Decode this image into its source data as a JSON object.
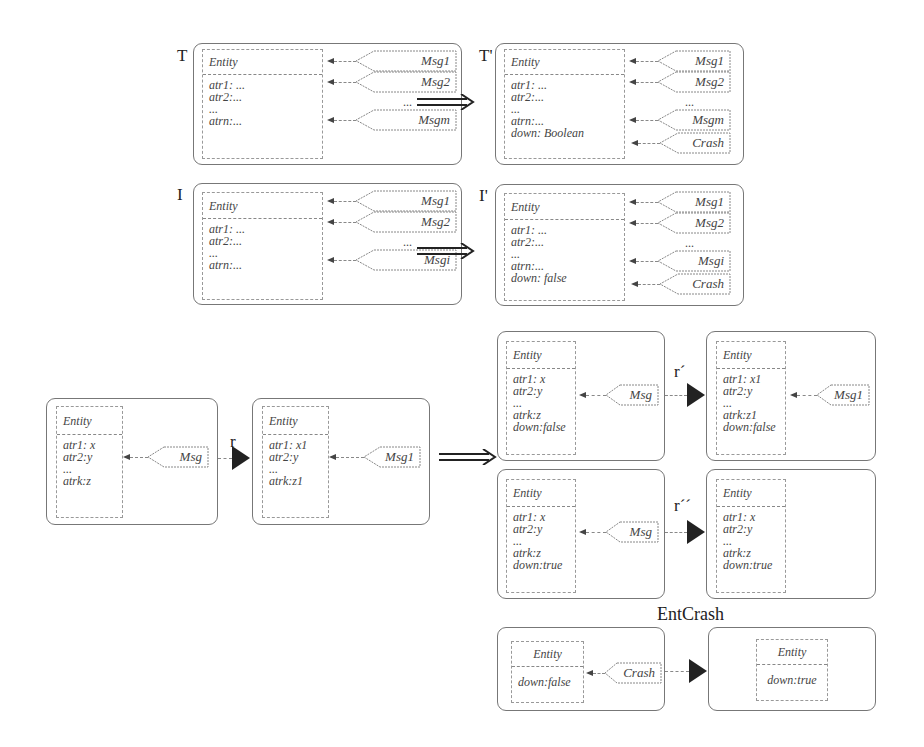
{
  "typeT": {
    "label": "T",
    "entity": "Entity",
    "attrs": [
      "atr1: ...",
      "atr2:...",
      "...",
      "atrn:..."
    ],
    "messages": [
      "Msg1",
      "Msg2",
      "Msgm"
    ],
    "ellipsis": "..."
  },
  "typeTprime": {
    "label": "T'",
    "entity": "Entity",
    "attrs": [
      "atr1: ...",
      "atr2:...",
      "...",
      "atrn:...",
      "down: Boolean"
    ],
    "messages": [
      "Msg1",
      "Msg2",
      "Msgm",
      "Crash"
    ],
    "ellipsis": "..."
  },
  "instI": {
    "label": "I",
    "entity": "Entity",
    "attrs": [
      "atr1: ...",
      "atr2:...",
      "...",
      "atrn:..."
    ],
    "messages": [
      "Msg1",
      "Msg2",
      "Msgi"
    ],
    "ellipsis": "..."
  },
  "instIprime": {
    "label": "I'",
    "entity": "Entity",
    "attrs": [
      "atr1: ...",
      "atr2:...",
      "...",
      "atrn:...",
      "down: false"
    ],
    "messages": [
      "Msg1",
      "Msg2",
      "Msgi",
      "Crash"
    ],
    "ellipsis": "..."
  },
  "ruleR": {
    "label": "r",
    "lhs": {
      "entity": "Entity",
      "attrs": [
        "atr1: x",
        "atr2:y",
        "...",
        "atrk:z"
      ],
      "message": "Msg"
    },
    "rhs": {
      "entity": "Entity",
      "attrs": [
        "atr1: x1",
        "atr2:y",
        "...",
        "atrk:z1"
      ],
      "message": "Msg1"
    }
  },
  "ruleRprime": {
    "label": "r´",
    "lhs": {
      "entity": "Entity",
      "attrs": [
        "atr1: x",
        "atr2:y",
        "...",
        "atrk:z",
        "down:false"
      ],
      "message": "Msg"
    },
    "rhs": {
      "entity": "Entity",
      "attrs": [
        "atr1: x1",
        "atr2:y",
        "...",
        "atrk:z1",
        "down:false"
      ],
      "message": "Msg1"
    }
  },
  "ruleRdouble": {
    "label": "r´´",
    "lhs": {
      "entity": "Entity",
      "attrs": [
        "atr1: x",
        "atr2:y",
        "...",
        "atrk:z",
        "down:true"
      ],
      "message": "Msg"
    },
    "rhs": {
      "entity": "Entity",
      "attrs": [
        "atr1: x",
        "atr2:y",
        "...",
        "atrk:z",
        "down:true"
      ]
    }
  },
  "entCrash": {
    "label": "EntCrash",
    "lhs": {
      "entity": "Entity",
      "attrs": [
        "down:false"
      ],
      "message": "Crash"
    },
    "rhs": {
      "entity": "Entity",
      "attrs": [
        "down:true"
      ]
    }
  }
}
